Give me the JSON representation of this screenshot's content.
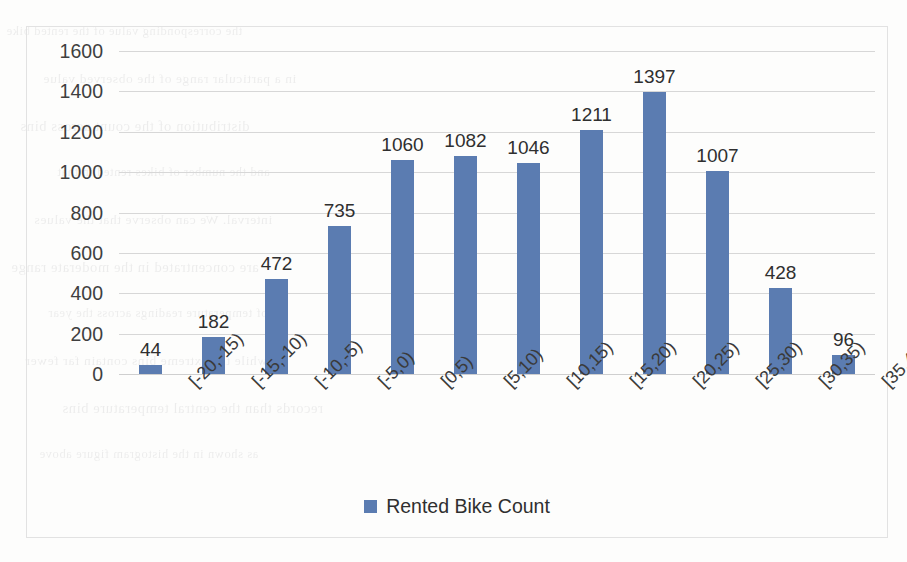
{
  "chart_data": {
    "type": "bar",
    "title": "",
    "xlabel": "",
    "ylabel": "",
    "categories": [
      "[-20,-15)",
      "[-15,-10)",
      "[-10,-5)",
      "[-5,0)",
      "[0,5)",
      "[5,10)",
      "[10,15)",
      "[15,20)",
      "[20,25)",
      "[25,30)",
      "[30,35)",
      "[35,40)"
    ],
    "values": [
      44,
      182,
      472,
      735,
      1060,
      1082,
      1046,
      1211,
      1397,
      1007,
      428,
      96
    ],
    "series": [
      {
        "name": "Rented Bike Count",
        "values": [
          44,
          182,
          472,
          735,
          1060,
          1082,
          1046,
          1211,
          1397,
          1007,
          428,
          96
        ],
        "color": "#5b7cb1"
      }
    ],
    "ylim": [
      0,
      1600
    ],
    "y_ticks": [
      0,
      200,
      400,
      600,
      800,
      1000,
      1200,
      1400,
      1600
    ],
    "y_tick_labels": [
      "0",
      "200",
      "400",
      "600",
      "800",
      "1000",
      "1200",
      "1400",
      "1600"
    ],
    "data_labels": [
      "44",
      "182",
      "472",
      "735",
      "1060",
      "1082",
      "1046",
      "1211",
      "1397",
      "1007",
      "428",
      "96"
    ],
    "grid": true,
    "grid_color": "#d7d7d7",
    "legend_position": "bottom",
    "x_tick_rotation": -45
  },
  "legend": {
    "label": "Rented Bike Count",
    "swatch_color": "#5b7cb1"
  },
  "frame": {
    "border_color": "#e2e2e2",
    "background": "#fdfdfc"
  },
  "scan_artifacts": {
    "bleed_through_lines": [
      "the corresponding value of the rented bike",
      "in a particular range of the observed value",
      "distribution of the count across bins",
      "and the number of bikes rented in that",
      "interval. We can observe that the values",
      "are concentrated in the moderate range",
      "of temperature readings across the year",
      "while the extreme bins contain far fewer",
      "records than the central temperature bins",
      "as shown in the histogram figure above"
    ]
  }
}
